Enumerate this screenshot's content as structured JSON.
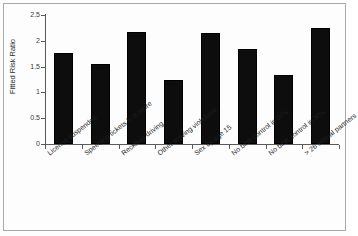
{
  "chart_data": {
    "type": "bar",
    "title": "",
    "xlabel": "",
    "ylabel": "Fitted Risk Ratio",
    "ylim": [
      0,
      2.5
    ],
    "ytick_labels": [
      "2.5",
      "2",
      "1.5",
      "1",
      "0.5",
      "0"
    ],
    "ytick_values": [
      2.5,
      2,
      1.5,
      1,
      0.5,
      0
    ],
    "grid": false,
    "legend": null,
    "bar_color": "#0d0d0d",
    "categories": [
      "License suspended",
      "Speeding tickets 5 or more",
      "Reckless driving",
      "Other moving violations",
      "Sex by age 15",
      "No birth control in 20's",
      "No birth control in 30's",
      "> 26 sexual partners"
    ],
    "values": [
      1.76,
      1.56,
      2.17,
      1.24,
      2.16,
      1.85,
      1.34,
      2.25
    ]
  },
  "figure": {
    "background": "#fdfdfd",
    "border_color": "#a9a9a9",
    "axis_color": "#5a5a5a"
  }
}
